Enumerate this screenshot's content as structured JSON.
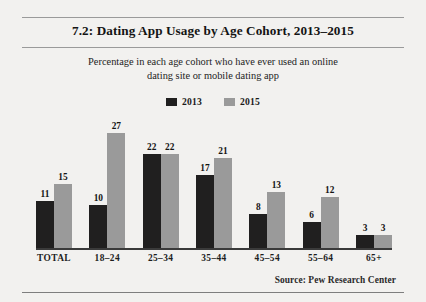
{
  "figure": {
    "title": "7.2: Dating App Usage by Age Cohort, 2013–2015",
    "subtitle_line1": "Percentage in each age cohort who have ever used an online",
    "subtitle_line2": "dating site or mobile dating app",
    "source": "Source:  Pew Research Center"
  },
  "colors": {
    "series_2013": "#201f1f",
    "series_2015": "#9a9a9a",
    "page_background": "#f2f1ef",
    "rule": "#9a9a9a",
    "axis": "#3a3a3a",
    "text": "#141414"
  },
  "legend": {
    "position": "top-center",
    "items": [
      {
        "label": "2013",
        "color": "#201f1f"
      },
      {
        "label": "2015",
        "color": "#9a9a9a"
      }
    ]
  },
  "chart_data": {
    "type": "bar",
    "title": "7.2: Dating App Usage by Age Cohort, 2013–2015",
    "subtitle": "Percentage in each age cohort who have ever used an online dating site or mobile dating app",
    "xlabel": "",
    "ylabel": "",
    "ylim": [
      0,
      29
    ],
    "grid": false,
    "legend_position": "top-center",
    "categories": [
      "TOTAL",
      "18–24",
      "25–34",
      "35–44",
      "45–54",
      "55–64",
      "65+"
    ],
    "series": [
      {
        "name": "2013",
        "color": "#201f1f",
        "values": [
          11,
          10,
          22,
          17,
          8,
          6,
          3
        ]
      },
      {
        "name": "2015",
        "color": "#9a9a9a",
        "values": [
          15,
          27,
          22,
          21,
          13,
          12,
          3
        ]
      }
    ],
    "annotations": [
      "Source:  Pew Research Center"
    ]
  }
}
